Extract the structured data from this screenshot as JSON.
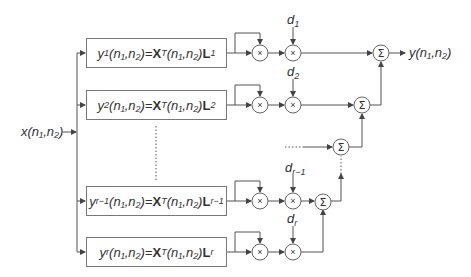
{
  "diagram": {
    "input_label": {
      "base": "x",
      "args": "(n₁,n₂)"
    },
    "output_label": {
      "base": "y",
      "args": "(n₁,n₂)"
    },
    "branches": [
      {
        "y_sub": "1",
        "L_sub": "1",
        "d_label": "d",
        "d_sub": "1"
      },
      {
        "y_sub": "2",
        "L_sub": "2",
        "d_label": "d",
        "d_sub": "2"
      },
      {
        "y_sub": "r−1",
        "L_sub": "r−1",
        "d_label": "d",
        "d_sub": "r−1"
      },
      {
        "y_sub": "r",
        "L_sub": "r",
        "d_label": "d",
        "d_sub": "r"
      }
    ],
    "box_formula": {
      "y": "y",
      "args": "(n₁,n₂)",
      "eq": "=",
      "X": "X",
      "T": "T",
      "args2": "(n₁,n₂)",
      "L": "L"
    },
    "multiply_symbol": "×",
    "sum_symbol": "Σ",
    "ellipsis": "....."
  }
}
